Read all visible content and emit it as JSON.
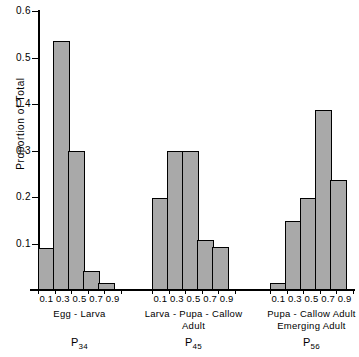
{
  "chart_data": {
    "type": "bar",
    "title": "",
    "xlabel": "",
    "ylabel": "Proportion  of   Total",
    "ylim": [
      0,
      0.6
    ],
    "ytick_labels": [
      "0.6",
      "0.5",
      "0.4",
      "0.3",
      "0.2",
      "0.1"
    ],
    "ytick_values": [
      0.6,
      0.5,
      0.4,
      0.3,
      0.2,
      0.1
    ],
    "grid": false,
    "legend": "none",
    "categories": [
      "0.1",
      "0.3",
      "0.5",
      "0.7",
      "0.9"
    ],
    "groups": [
      {
        "key": "P34",
        "p_label": "P",
        "p_sub": "34",
        "caption_lines": [
          "Egg - Larva"
        ],
        "categories": [
          "0.1",
          "0.3",
          "0.5",
          "0.7",
          "0.9"
        ],
        "values": [
          0.09,
          0.535,
          0.3,
          0.04,
          0.015
        ]
      },
      {
        "key": "P45",
        "p_label": "P",
        "p_sub": "45",
        "caption_lines": [
          "Larva - Pupa - Callow",
          "Adult"
        ],
        "categories": [
          "0.1",
          "0.3",
          "0.5",
          "0.7",
          "0.9"
        ],
        "values": [
          0.198,
          0.298,
          0.298,
          0.107,
          0.093
        ]
      },
      {
        "key": "P56",
        "p_label": "P",
        "p_sub": "56",
        "caption_lines": [
          "Pupa - Callow   Adult",
          "Emerging   Adult"
        ],
        "categories": [
          "0.1",
          "0.3",
          "0.5",
          "0.7",
          "0.9"
        ],
        "values": [
          0.015,
          0.148,
          0.198,
          0.388,
          0.236
        ]
      }
    ],
    "colors": {
      "bar_fill": "#a9a9a9",
      "bar_stroke": "#000000",
      "axis": "#000000",
      "background": "#ffffff"
    }
  }
}
